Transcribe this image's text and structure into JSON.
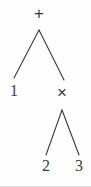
{
  "figure": {
    "width": 91,
    "height": 187,
    "background_color": "#fefefe",
    "stroke_color": "#3a3a42",
    "text_color": "#3a3a42"
  },
  "tree": {
    "expression": "1 + 2 × 3",
    "nodes": [
      {
        "id": "root",
        "label": "+",
        "kind": "operator",
        "x": 39,
        "y": 13
      },
      {
        "id": "left",
        "label": "1",
        "kind": "leaf",
        "x": 14,
        "y": 91
      },
      {
        "id": "right",
        "label": "×",
        "kind": "operator",
        "x": 62,
        "y": 92
      },
      {
        "id": "rl",
        "label": "2",
        "kind": "leaf",
        "x": 46,
        "y": 166
      },
      {
        "id": "rr",
        "label": "3",
        "kind": "leaf",
        "x": 79,
        "y": 166
      }
    ],
    "edges": [
      {
        "from": "root",
        "to": "left",
        "x1": 39,
        "y1": 30,
        "x2": 14,
        "y2": 78
      },
      {
        "from": "root",
        "to": "right",
        "x1": 39,
        "y1": 30,
        "x2": 64,
        "y2": 80
      },
      {
        "from": "right",
        "to": "rl",
        "x1": 62,
        "y1": 110,
        "x2": 46,
        "y2": 155
      },
      {
        "from": "right",
        "to": "rr",
        "x1": 62,
        "y1": 110,
        "x2": 79,
        "y2": 155
      }
    ]
  }
}
